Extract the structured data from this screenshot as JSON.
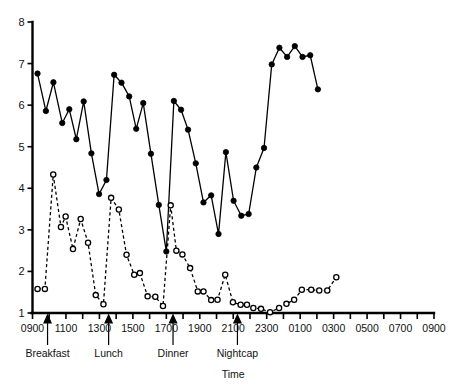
{
  "chart_data": {
    "type": "line",
    "title": "",
    "xlabel": "Time",
    "ylabel": "",
    "grid": false,
    "legend": "none",
    "ylim": [
      1,
      8
    ],
    "yticks": [
      1,
      2,
      3,
      4,
      5,
      6,
      7,
      8
    ],
    "ytick_labels": [
      "1",
      "2",
      "3",
      "4",
      "5",
      "6",
      "7",
      "8"
    ],
    "xlim_hours": [
      0,
      24
    ],
    "x_tick_hours": [
      0,
      1,
      2,
      3,
      4,
      5,
      6,
      7,
      8,
      9,
      10,
      11,
      12,
      13,
      14,
      15,
      16,
      17,
      18,
      19,
      20,
      21,
      22,
      23,
      24
    ],
    "xtick_labels": [
      "0900",
      "1100",
      "1300",
      "1500",
      "1700",
      "1900",
      "2100",
      "2300",
      "0100",
      "0300",
      "0500",
      "0700",
      "0900"
    ],
    "xtick_label_hours": [
      0,
      2,
      4,
      6,
      8,
      10,
      12,
      14,
      16,
      18,
      20,
      22,
      24
    ],
    "annotations": [
      {
        "label": "Breakfast",
        "hour": 0.9
      },
      {
        "label": "Lunch",
        "hour": 4.55
      },
      {
        "label": "Dinner",
        "hour": 8.4
      },
      {
        "label": "Nightcap",
        "hour": 12.25
      }
    ],
    "series": [
      {
        "name": "filled-circle-series",
        "marker": "filled-circle",
        "line_style": "solid",
        "color": "#000000",
        "points": [
          {
            "hour": 0.3,
            "value": 6.76
          },
          {
            "hour": 0.8,
            "value": 5.86
          },
          {
            "hour": 1.25,
            "value": 6.55
          },
          {
            "hour": 1.78,
            "value": 5.57
          },
          {
            "hour": 2.2,
            "value": 5.9
          },
          {
            "hour": 2.62,
            "value": 5.18
          },
          {
            "hour": 3.06,
            "value": 6.09
          },
          {
            "hour": 3.52,
            "value": 4.84
          },
          {
            "hour": 3.98,
            "value": 3.86
          },
          {
            "hour": 4.42,
            "value": 4.2
          },
          {
            "hour": 4.88,
            "value": 6.73
          },
          {
            "hour": 5.32,
            "value": 6.54
          },
          {
            "hour": 5.78,
            "value": 6.21
          },
          {
            "hour": 6.2,
            "value": 5.43
          },
          {
            "hour": 6.62,
            "value": 6.05
          },
          {
            "hour": 7.08,
            "value": 4.83
          },
          {
            "hour": 7.55,
            "value": 3.6
          },
          {
            "hour": 8.0,
            "value": 2.48
          },
          {
            "hour": 8.45,
            "value": 6.1
          },
          {
            "hour": 8.88,
            "value": 5.89
          },
          {
            "hour": 9.3,
            "value": 5.41
          },
          {
            "hour": 9.76,
            "value": 4.6
          },
          {
            "hour": 10.22,
            "value": 3.66
          },
          {
            "hour": 10.68,
            "value": 3.83
          },
          {
            "hour": 11.12,
            "value": 2.9
          },
          {
            "hour": 11.56,
            "value": 4.87
          },
          {
            "hour": 12.02,
            "value": 3.7
          },
          {
            "hour": 12.48,
            "value": 3.34
          },
          {
            "hour": 12.92,
            "value": 3.38
          },
          {
            "hour": 13.38,
            "value": 4.5
          },
          {
            "hour": 13.84,
            "value": 4.97
          },
          {
            "hour": 14.3,
            "value": 6.98
          },
          {
            "hour": 14.76,
            "value": 7.38
          },
          {
            "hour": 15.22,
            "value": 7.16
          },
          {
            "hour": 15.68,
            "value": 7.42
          },
          {
            "hour": 16.14,
            "value": 7.16
          },
          {
            "hour": 16.6,
            "value": 7.2
          },
          {
            "hour": 17.06,
            "value": 6.38
          }
        ]
      },
      {
        "name": "open-circle-series",
        "marker": "open-circle",
        "line_style": "dashed",
        "color": "#000000",
        "points": [
          {
            "hour": 0.3,
            "value": 1.58
          },
          {
            "hour": 0.74,
            "value": 1.58
          },
          {
            "hour": 1.24,
            "value": 4.33
          },
          {
            "hour": 1.7,
            "value": 3.07
          },
          {
            "hour": 1.98,
            "value": 3.32
          },
          {
            "hour": 2.42,
            "value": 2.54
          },
          {
            "hour": 2.88,
            "value": 3.26
          },
          {
            "hour": 3.32,
            "value": 2.69
          },
          {
            "hour": 3.78,
            "value": 1.43
          },
          {
            "hour": 4.24,
            "value": 1.21
          },
          {
            "hour": 4.7,
            "value": 3.77
          },
          {
            "hour": 5.16,
            "value": 3.49
          },
          {
            "hour": 5.62,
            "value": 2.4
          },
          {
            "hour": 6.08,
            "value": 1.92
          },
          {
            "hour": 6.42,
            "value": 1.96
          },
          {
            "hour": 6.88,
            "value": 1.4
          },
          {
            "hour": 7.34,
            "value": 1.39
          },
          {
            "hour": 7.8,
            "value": 1.17
          },
          {
            "hour": 8.26,
            "value": 3.59
          },
          {
            "hour": 8.6,
            "value": 2.5
          },
          {
            "hour": 8.96,
            "value": 2.41
          },
          {
            "hour": 9.42,
            "value": 2.08
          },
          {
            "hour": 9.88,
            "value": 1.52
          },
          {
            "hour": 10.22,
            "value": 1.52
          },
          {
            "hour": 10.68,
            "value": 1.31
          },
          {
            "hour": 11.06,
            "value": 1.32
          },
          {
            "hour": 11.52,
            "value": 1.92
          },
          {
            "hour": 11.98,
            "value": 1.26
          },
          {
            "hour": 12.44,
            "value": 1.2
          },
          {
            "hour": 12.82,
            "value": 1.2
          },
          {
            "hour": 13.2,
            "value": 1.12
          },
          {
            "hour": 13.66,
            "value": 1.1
          },
          {
            "hour": 14.2,
            "value": 1.02
          },
          {
            "hour": 14.74,
            "value": 1.12
          },
          {
            "hour": 15.18,
            "value": 1.22
          },
          {
            "hour": 15.64,
            "value": 1.32
          },
          {
            "hour": 16.1,
            "value": 1.56
          },
          {
            "hour": 16.66,
            "value": 1.56
          },
          {
            "hour": 17.14,
            "value": 1.54
          },
          {
            "hour": 17.62,
            "value": 1.54
          },
          {
            "hour": 18.16,
            "value": 1.86
          }
        ]
      }
    ]
  }
}
